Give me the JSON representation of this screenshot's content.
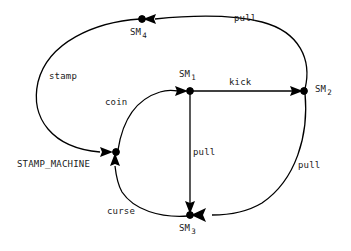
{
  "diagram": {
    "stroke_color": "#000000",
    "background_color": "#ffffff",
    "nodes": [
      {
        "id": "SM4",
        "label": "SM",
        "sub": "4",
        "x": 142,
        "y": 19,
        "label_pos": "below"
      },
      {
        "id": "SM1",
        "label": "SM",
        "sub": "1",
        "x": 190,
        "y": 91,
        "label_pos": "above"
      },
      {
        "id": "SM2",
        "label": "SM",
        "sub": "2",
        "x": 304,
        "y": 91,
        "label_pos": "right"
      },
      {
        "id": "SM3",
        "label": "SM",
        "sub": "3",
        "x": 190,
        "y": 215,
        "label_pos": "below"
      },
      {
        "id": "STAMP_MACHINE",
        "label": "STAMP_MACHINE",
        "sub": "",
        "x": 116,
        "y": 152,
        "label_pos": "left"
      }
    ],
    "edges": [
      {
        "id": "e-stamp",
        "from": "SM4",
        "to": "STAMP_MACHINE",
        "label": "stamp",
        "label_x": 49,
        "label_y": 72
      },
      {
        "id": "e-coin",
        "from": "STAMP_MACHINE",
        "to": "SM1",
        "label": "coin",
        "label_x": 105,
        "label_y": 98
      },
      {
        "id": "e-kick",
        "from": "SM1",
        "to": "SM2",
        "label": "kick",
        "label_x": 229,
        "label_y": 78
      },
      {
        "id": "e-pull-top",
        "from": "SM2",
        "to": "SM4",
        "label": "pull",
        "label_x": 234,
        "label_y": 14
      },
      {
        "id": "e-pull-right",
        "from": "SM2",
        "to": "SM3",
        "label": "pull",
        "label_x": 298,
        "label_y": 161
      },
      {
        "id": "e-pull-mid",
        "from": "SM1",
        "to": "SM3",
        "label": "pull",
        "label_x": 193,
        "label_y": 148
      },
      {
        "id": "e-curse",
        "from": "SM3",
        "to": "STAMP_MACHINE",
        "label": "curse",
        "label_x": 107,
        "label_y": 207
      }
    ]
  }
}
